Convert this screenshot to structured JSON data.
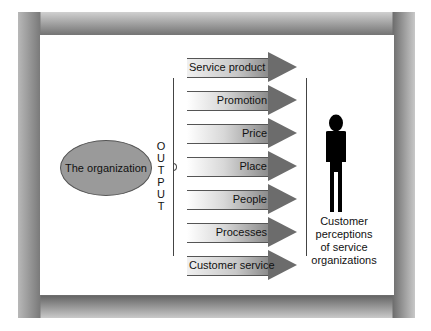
{
  "diagram": {
    "source_node": {
      "label": "The organization",
      "fill": "#9a9a9a"
    },
    "output_label": [
      "O",
      "U",
      "T",
      "P",
      "U",
      "T"
    ],
    "outputs": [
      {
        "label": "Service product"
      },
      {
        "label": "Promotion"
      },
      {
        "label": "Price"
      },
      {
        "label": "Place"
      },
      {
        "label": "People"
      },
      {
        "label": "Processes"
      },
      {
        "label": "Customer service"
      }
    ],
    "target": {
      "icon": "person-silhouette-icon",
      "caption_lines": [
        "Customer",
        "perceptions",
        "of service",
        "organizations"
      ]
    },
    "colors": {
      "arrow_head": "#6c6c6c",
      "frame": "#7a7a7a",
      "background": "#ffffff"
    }
  }
}
